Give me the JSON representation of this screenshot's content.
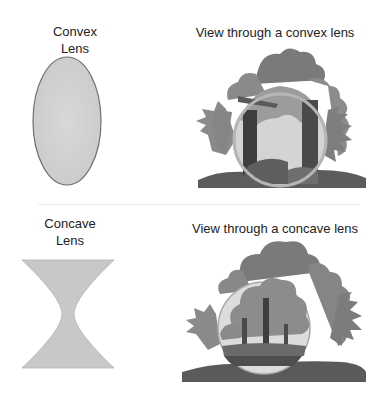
{
  "convex": {
    "title_line1": "Convex",
    "title_line2": "Lens",
    "view_title": "View through a convex lens",
    "lens_fill": "#d2d2d2",
    "lens_stroke": "#707070"
  },
  "concave": {
    "title_line1": "Concave",
    "title_line2": "Lens",
    "view_title": "View through a concave lens",
    "lens_fill": "#c8c8c8"
  }
}
